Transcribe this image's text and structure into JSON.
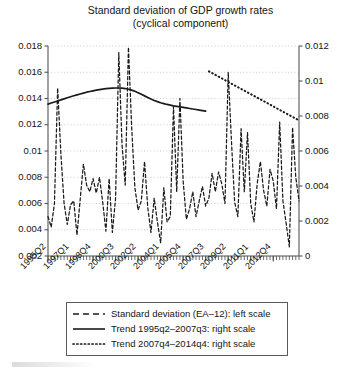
{
  "chart_data": {
    "type": "line",
    "title": "Standard deviation of GDP growth rates",
    "subtitle": "(cyclical component)",
    "xlabel": "",
    "ylabel": "",
    "y2label": "",
    "ylim": [
      0.002,
      0.018
    ],
    "y2lim": [
      0,
      0.012
    ],
    "yticks": [
      "0.002",
      "0.004",
      "0.006",
      "0.008",
      "0.01",
      "0.012",
      "0.014",
      "0.016",
      "0.018"
    ],
    "ytick_values": [
      0.002,
      0.004,
      0.006,
      0.008,
      0.01,
      0.012,
      0.014,
      0.016,
      0.018
    ],
    "y2ticks": [
      "0",
      "0.002",
      "0.004",
      "0.006",
      "0.008",
      "0.01",
      "0.012"
    ],
    "y2tick_values": [
      0,
      0.002,
      0.004,
      0.006,
      0.008,
      0.01,
      0.012
    ],
    "grid": true,
    "grid_style": "dotted-horizontal",
    "legend_position": "below-plot",
    "xtick_labels": [
      "1995Q2",
      "1997Q1",
      "1998Q4",
      "2000Q3",
      "2002Q2",
      "2004Q1",
      "2005Q4",
      "2007Q3",
      "2009Q2",
      "2011Q1",
      "2012Q4"
    ],
    "xtick_indices": [
      0,
      7,
      14,
      21,
      28,
      35,
      42,
      49,
      56,
      63,
      70
    ],
    "x_period_start": "1995Q2",
    "x_period_end": "2014Q4",
    "n_periods": 79,
    "series": [
      {
        "name": "Standard deviation (EA-12): left scale",
        "axis": "left",
        "style": "dashed",
        "values": [
          0.005,
          0.0042,
          0.006,
          0.0148,
          0.0098,
          0.006,
          0.0044,
          0.0059,
          0.0062,
          0.0036,
          0.0063,
          0.009,
          0.0074,
          0.0069,
          0.0079,
          0.0068,
          0.008,
          0.0061,
          0.0039,
          0.0079,
          0.0038,
          0.0064,
          0.0175,
          0.0105,
          0.0074,
          0.0179,
          0.0118,
          0.0072,
          0.0055,
          0.0062,
          0.0092,
          0.0057,
          0.0038,
          0.0064,
          0.0046,
          0.003,
          0.0072,
          0.0046,
          0.005,
          0.0134,
          0.0069,
          0.014,
          0.0077,
          0.0048,
          0.0056,
          0.0069,
          0.005,
          0.0062,
          0.0073,
          0.0058,
          0.0064,
          0.0083,
          0.0069,
          0.0084,
          0.0075,
          0.006,
          0.016,
          0.0108,
          0.0061,
          0.005,
          0.0117,
          0.0069,
          0.0114,
          0.006,
          0.0046,
          0.0075,
          0.0092,
          0.007,
          0.0058,
          0.0086,
          0.0077,
          0.0056,
          0.0122,
          0.0062,
          0.0045,
          0.0027,
          0.0118,
          0.008,
          0.0062
        ]
      },
      {
        "name": "Trend 1995q2–2007q3: right scale",
        "axis": "right",
        "style": "solid",
        "x_start_index": 0,
        "x_end_index": 49,
        "values": [
          0.00868,
          0.00874,
          0.0088,
          0.00886,
          0.00892,
          0.00898,
          0.00904,
          0.0091,
          0.00916,
          0.00921,
          0.00926,
          0.00931,
          0.00936,
          0.0094,
          0.00944,
          0.00948,
          0.00951,
          0.00954,
          0.00956,
          0.00958,
          0.00959,
          0.0096,
          0.0096,
          0.00959,
          0.00957,
          0.00953,
          0.00948,
          0.00941,
          0.00933,
          0.00924,
          0.00915,
          0.00906,
          0.00897,
          0.00889,
          0.00882,
          0.00876,
          0.00871,
          0.00866,
          0.00862,
          0.00858,
          0.00855,
          0.00852,
          0.00849,
          0.00846,
          0.00843,
          0.0084,
          0.00837,
          0.00834,
          0.00831,
          0.00828
        ]
      },
      {
        "name": "Trend 2007q4–2014q4: right scale",
        "axis": "right",
        "style": "dotted",
        "x_start_index": 50,
        "x_end_index": 78,
        "values": [
          0.01055,
          0.01045,
          0.01035,
          0.01025,
          0.01015,
          0.01005,
          0.00995,
          0.00985,
          0.00975,
          0.00965,
          0.00955,
          0.00945,
          0.00935,
          0.00925,
          0.00915,
          0.00905,
          0.00895,
          0.00885,
          0.00875,
          0.00865,
          0.00855,
          0.00845,
          0.00835,
          0.00825,
          0.00815,
          0.00805,
          0.00795,
          0.00785,
          0.00775
        ]
      }
    ]
  },
  "legend": {
    "items": [
      {
        "label": "Standard deviation (EA–12): left scale",
        "style": "dashed"
      },
      {
        "label": "Trend 1995q2–2007q3: right scale",
        "style": "solid"
      },
      {
        "label": "Trend 2007q4–2014q4: right scale",
        "style": "dotted"
      }
    ]
  },
  "colors": {
    "line": "#1a1a1a",
    "grid": "#c8c8c8",
    "axis": "#555555",
    "background": "#ffffff"
  }
}
